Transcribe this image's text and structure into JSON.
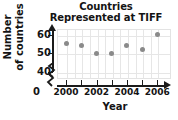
{
  "chart_data": {
    "type": "scatter",
    "title": "Countries Represented at TIFF",
    "title_line1": "Countries",
    "title_line2": "Represented at TIFF",
    "xlabel": "Year",
    "ylabel": "Number of countries",
    "ylabel_line1": "Number",
    "ylabel_line2": "of countries",
    "x": [
      2000,
      2001,
      2002,
      2003,
      2004,
      2005,
      2006
    ],
    "values": [
      55,
      54,
      50,
      50,
      54,
      52,
      60
    ],
    "xlim": [
      1999.4,
      2006.9
    ],
    "ylim": [
      36,
      63
    ],
    "yticks": [
      60,
      50,
      40
    ],
    "ytick_labels": [
      "60",
      "50",
      "40"
    ],
    "xticks": [
      2000,
      2001,
      2002,
      2003,
      2004,
      2005,
      2006
    ],
    "xtick_labels": [
      "2000",
      "2002",
      "2004",
      "2006"
    ],
    "xtick_labeled_values": [
      2000,
      2002,
      2004,
      2006
    ],
    "origin_label": "0",
    "grid": true,
    "legend": "none",
    "axis_break_y": true,
    "axis_break_x": true,
    "marker_color": "#8a8a8a",
    "grid_color": "#e6e6e6",
    "axis_color": "#1b1b1b",
    "text_color": "#141414"
  }
}
